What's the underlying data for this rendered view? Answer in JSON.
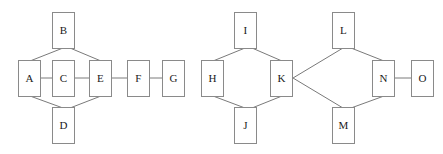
{
  "diagram": {
    "width": 443,
    "height": 154,
    "style": {
      "background_color": "#ffffff",
      "node_fill": "#ffffff",
      "node_border_color": "#8a8a8a",
      "edge_color": "#7a7a7a",
      "label_color": "#1a1a1a"
    },
    "node_size": {
      "width": 23,
      "height": 37
    },
    "nodes": [
      {
        "id": "A",
        "label": "A",
        "x": 18,
        "y": 60
      },
      {
        "id": "B",
        "label": "B",
        "x": 52,
        "y": 12
      },
      {
        "id": "C",
        "label": "C",
        "x": 52,
        "y": 60
      },
      {
        "id": "D",
        "label": "D",
        "x": 52,
        "y": 107
      },
      {
        "id": "E",
        "label": "E",
        "x": 89,
        "y": 60
      },
      {
        "id": "F",
        "label": "F",
        "x": 127,
        "y": 60
      },
      {
        "id": "G",
        "label": "G",
        "x": 162,
        "y": 60
      },
      {
        "id": "H",
        "label": "H",
        "x": 201,
        "y": 60
      },
      {
        "id": "I",
        "label": "I",
        "x": 234,
        "y": 12
      },
      {
        "id": "J",
        "label": "J",
        "x": 234,
        "y": 107
      },
      {
        "id": "K",
        "label": "K",
        "x": 270,
        "y": 60
      },
      {
        "id": "L",
        "label": "L",
        "x": 332,
        "y": 12
      },
      {
        "id": "M",
        "label": "M",
        "x": 332,
        "y": 107
      },
      {
        "id": "N",
        "label": "N",
        "x": 372,
        "y": 60
      },
      {
        "id": "O",
        "label": "O",
        "x": 411,
        "y": 60
      }
    ],
    "edges": [
      {
        "from": "A",
        "to": "B",
        "x1": 30,
        "y1": 61,
        "x2": 63,
        "y2": 48
      },
      {
        "from": "B",
        "to": "E",
        "x1": 70,
        "y1": 48,
        "x2": 101,
        "y2": 61
      },
      {
        "from": "A",
        "to": "C",
        "x1": 41,
        "y1": 78,
        "x2": 52,
        "y2": 78
      },
      {
        "from": "C",
        "to": "E",
        "x1": 75,
        "y1": 78,
        "x2": 89,
        "y2": 78
      },
      {
        "from": "A",
        "to": "D",
        "x1": 30,
        "y1": 96,
        "x2": 63,
        "y2": 108
      },
      {
        "from": "D",
        "to": "E",
        "x1": 70,
        "y1": 108,
        "x2": 101,
        "y2": 96
      },
      {
        "from": "E",
        "to": "F",
        "x1": 112,
        "y1": 78,
        "x2": 127,
        "y2": 78
      },
      {
        "from": "F",
        "to": "G",
        "x1": 150,
        "y1": 78,
        "x2": 162,
        "y2": 78
      },
      {
        "from": "H",
        "to": "I",
        "x1": 213,
        "y1": 61,
        "x2": 245,
        "y2": 48
      },
      {
        "from": "I",
        "to": "K",
        "x1": 252,
        "y1": 48,
        "x2": 282,
        "y2": 61
      },
      {
        "from": "H",
        "to": "J",
        "x1": 213,
        "y1": 96,
        "x2": 245,
        "y2": 108
      },
      {
        "from": "J",
        "to": "K",
        "x1": 252,
        "y1": 108,
        "x2": 282,
        "y2": 96
      },
      {
        "from": "K",
        "to": "L",
        "x1": 293,
        "y1": 78,
        "x2": 343,
        "y2": 48
      },
      {
        "from": "L",
        "to": "N",
        "x1": 351,
        "y1": 48,
        "x2": 384,
        "y2": 61
      },
      {
        "from": "K",
        "to": "M",
        "x1": 293,
        "y1": 78,
        "x2": 343,
        "y2": 108
      },
      {
        "from": "M",
        "to": "N",
        "x1": 351,
        "y1": 108,
        "x2": 384,
        "y2": 96
      },
      {
        "from": "N",
        "to": "O",
        "x1": 395,
        "y1": 78,
        "x2": 411,
        "y2": 78
      }
    ],
    "components": [
      {
        "name": "component-1",
        "members": [
          "A",
          "B",
          "C",
          "D",
          "E",
          "F",
          "G"
        ]
      },
      {
        "name": "component-2",
        "members": [
          "H",
          "I",
          "J",
          "K",
          "L",
          "M",
          "N",
          "O"
        ]
      }
    ]
  }
}
